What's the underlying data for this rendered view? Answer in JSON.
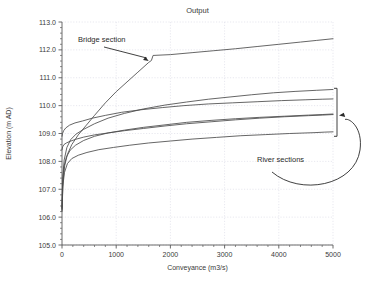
{
  "chart_data": {
    "type": "line",
    "title": "Output",
    "xlabel": "Conveyance (m3/s)",
    "ylabel": "Elevation (m AD)",
    "xlim": [
      0,
      5000
    ],
    "ylim": [
      105.0,
      113.0
    ],
    "grid": true,
    "legend_position": "none",
    "xticks": [
      0,
      1000,
      2000,
      3000,
      4000,
      5000
    ],
    "xtick_labels": [
      "0",
      "1000",
      "2000",
      "3000",
      "4000",
      "5000"
    ],
    "x_minor_tick_step": 200,
    "yticks": [
      105.0,
      106.0,
      107.0,
      108.0,
      109.0,
      110.0,
      111.0,
      112.0,
      113.0
    ],
    "ytick_labels": [
      "105.0",
      "106.0",
      "107.0",
      "108.0",
      "109.0",
      "110.0",
      "111.0",
      "112.0",
      "113.0"
    ],
    "y_minor_tick_step": 0.2,
    "line_color": "#4a4a4a",
    "series": [
      {
        "name": "Bridge section",
        "x": [
          0,
          20,
          50,
          100,
          180,
          300,
          450,
          600,
          800,
          1000,
          1200,
          1400,
          1600,
          1650,
          1680,
          2000,
          2400,
          2800,
          3200,
          3600,
          4000,
          4400,
          4700,
          5000
        ],
        "values": [
          106.2,
          107.3,
          107.85,
          108.25,
          108.6,
          108.95,
          109.3,
          109.65,
          110.1,
          110.5,
          110.85,
          111.2,
          111.55,
          111.62,
          111.8,
          111.83,
          111.9,
          111.97,
          112.04,
          112.12,
          112.2,
          112.28,
          112.34,
          112.4
        ]
      },
      {
        "name": "River section 1",
        "x": [
          0,
          15,
          40,
          90,
          160,
          260,
          400,
          600,
          850,
          1150,
          1500,
          1900,
          2300,
          2700,
          3100,
          3500,
          3900,
          4300,
          4700,
          5000
        ],
        "values": [
          106.35,
          107.45,
          108.05,
          108.5,
          108.78,
          108.98,
          109.15,
          109.35,
          109.55,
          109.72,
          109.88,
          110.02,
          110.13,
          110.23,
          110.31,
          110.39,
          110.46,
          110.51,
          110.55,
          110.58
        ]
      },
      {
        "name": "River section 2",
        "x": [
          0,
          10,
          30,
          70,
          140,
          240,
          380,
          560,
          800,
          1100,
          1450,
          1850,
          2250,
          2700,
          3150,
          3600,
          4050,
          4500,
          4800,
          5000
        ],
        "values": [
          108.9,
          109.0,
          109.1,
          109.2,
          109.3,
          109.38,
          109.45,
          109.55,
          109.65,
          109.76,
          109.85,
          109.93,
          110.0,
          110.06,
          110.1,
          110.14,
          110.18,
          110.21,
          110.23,
          110.24
        ]
      },
      {
        "name": "River section 3",
        "x": [
          0,
          12,
          35,
          80,
          150,
          250,
          400,
          600,
          850,
          1150,
          1500,
          1900,
          2300,
          2750,
          3200,
          3650,
          4100,
          4550,
          4800,
          5000
        ],
        "values": [
          106.3,
          107.25,
          107.8,
          108.15,
          108.4,
          108.58,
          108.75,
          108.9,
          109.02,
          109.12,
          109.22,
          109.31,
          109.4,
          109.47,
          109.53,
          109.58,
          109.62,
          109.66,
          109.68,
          109.7
        ]
      },
      {
        "name": "River section 4",
        "x": [
          0,
          12,
          35,
          80,
          150,
          250,
          400,
          600,
          850,
          1150,
          1500,
          1900,
          2300,
          2750,
          3200,
          3650,
          4100,
          4550,
          4800,
          5000
        ],
        "values": [
          108.42,
          108.52,
          108.6,
          108.66,
          108.72,
          108.79,
          108.87,
          108.95,
          109.02,
          109.1,
          109.18,
          109.27,
          109.35,
          109.42,
          109.49,
          109.55,
          109.6,
          109.64,
          109.66,
          109.68
        ]
      },
      {
        "name": "River section 5",
        "x": [
          0,
          15,
          45,
          100,
          180,
          300,
          460,
          680,
          950,
          1250,
          1600,
          2000,
          2400,
          2850,
          3300,
          3750,
          4200,
          4650,
          4850,
          5000
        ],
        "values": [
          106.25,
          107.1,
          107.6,
          107.92,
          108.1,
          108.22,
          108.32,
          108.42,
          108.5,
          108.58,
          108.66,
          108.73,
          108.8,
          108.86,
          108.92,
          108.96,
          109.0,
          109.03,
          109.05,
          109.06
        ]
      }
    ],
    "annotations": [
      {
        "id": "bridge-section",
        "label": "Bridge section",
        "points_to_x": 1600,
        "points_to_y": 111.6
      },
      {
        "id": "river-sections",
        "label": "River sections",
        "points_to_x": 5050,
        "points_to_y": 109.65
      }
    ]
  }
}
